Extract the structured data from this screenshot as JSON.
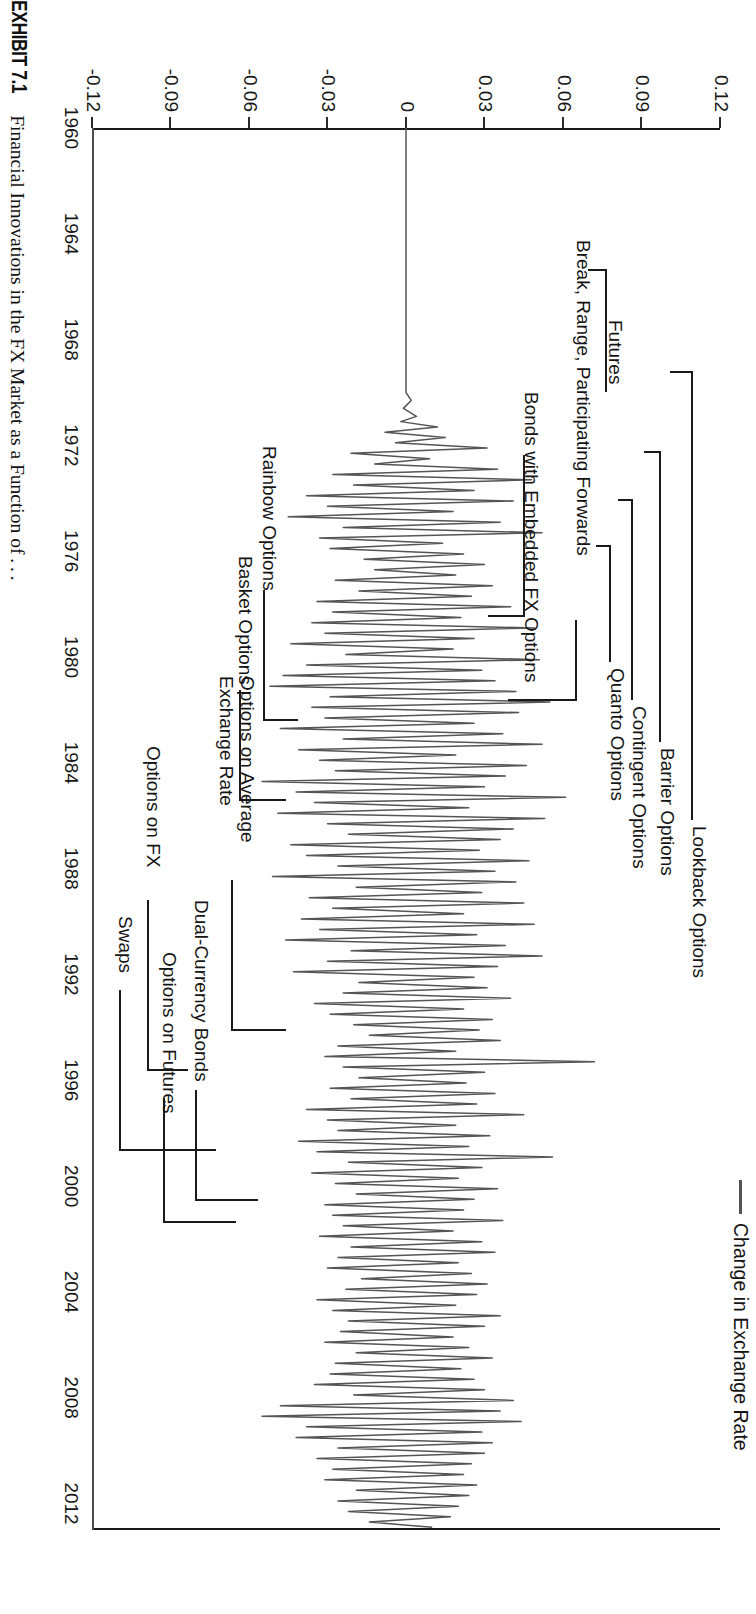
{
  "figure": {
    "exhibit_label": "EXHIBIT 7.1",
    "caption": "Financial Innovations in the FX Market as a Function of . . ."
  },
  "legend": {
    "series_label": "Change in Exchange Rate",
    "swatch_color": "#555555"
  },
  "axes": {
    "y_axis_title": "Percent Change",
    "y_ticks": [
      "0.12",
      "0.09",
      "0.06",
      "0.03",
      "0",
      "-0.03",
      "-0.06",
      "-0.09",
      "-0.12"
    ],
    "x_ticks": [
      "1960",
      "1964",
      "1968",
      "1972",
      "1976",
      "1980",
      "1984",
      "1988",
      "1992",
      "1996",
      "2000",
      "2004",
      "2008",
      "2012"
    ]
  },
  "annotations": {
    "futures": "Futures",
    "bonds_embedded": "Bonds with Embedded FX Options",
    "break_range": "Break, Range, Participating Forwards",
    "lookback": "Lookback Options",
    "barrier": "Barrier Options",
    "contingent": "Contingent Options",
    "quanto": "Quanto Options",
    "options_on_fx": "Options on FX",
    "swaps": "Swaps",
    "options_on_futures": "Options on Futures",
    "dual_currency": "Dual-Currency Bonds",
    "options_avg_rate": "Options on Average Exchange Rate",
    "basket": "Basket Options",
    "rainbow": "Rainbow Options"
  },
  "chart_data": {
    "type": "line",
    "xlabel": "",
    "ylabel": "Percent Change",
    "series_name": "Change in Exchange Rate",
    "xlim": [
      1960,
      2013
    ],
    "ylim": [
      -0.12,
      0.12
    ],
    "grid": false,
    "legend_position": "top-right",
    "x_tick_values": [
      1960,
      1964,
      1968,
      1972,
      1976,
      1980,
      1984,
      1988,
      1992,
      1996,
      2000,
      2004,
      2008,
      2012
    ],
    "y_tick_values": [
      -0.12,
      -0.09,
      -0.06,
      -0.03,
      0,
      0.03,
      0.06,
      0.09,
      0.12
    ],
    "note": "Monthly percent change in the exchange rate; flat (zero) from 1960 until the early 1970s collapse of Bretton Woods, then persistently volatile.",
    "x": [
      1960.0,
      1960.5,
      1961.0,
      1961.5,
      1962.0,
      1962.5,
      1963.0,
      1963.5,
      1964.0,
      1964.5,
      1965.0,
      1965.5,
      1966.0,
      1966.5,
      1967.0,
      1967.5,
      1968.0,
      1968.5,
      1969.0,
      1969.5,
      1970.0,
      1970.3,
      1970.6,
      1970.9,
      1971.1,
      1971.3,
      1971.5,
      1971.7,
      1971.9,
      1972.1,
      1972.3,
      1972.5,
      1972.7,
      1972.9,
      1973.1,
      1973.3,
      1973.5,
      1973.7,
      1973.9,
      1974.1,
      1974.3,
      1974.5,
      1974.7,
      1974.9,
      1975.1,
      1975.3,
      1975.5,
      1975.7,
      1975.9,
      1976.1,
      1976.3,
      1976.5,
      1976.7,
      1976.9,
      1977.1,
      1977.3,
      1977.5,
      1977.7,
      1977.9,
      1978.1,
      1978.3,
      1978.5,
      1978.7,
      1978.9,
      1979.1,
      1979.3,
      1979.5,
      1979.7,
      1979.9,
      1980.1,
      1980.3,
      1980.5,
      1980.7,
      1980.9,
      1981.1,
      1981.3,
      1981.5,
      1981.7,
      1981.9,
      1982.1,
      1982.3,
      1982.5,
      1982.7,
      1982.9,
      1983.1,
      1983.3,
      1983.5,
      1983.7,
      1983.9,
      1984.1,
      1984.3,
      1984.5,
      1984.7,
      1984.9,
      1985.1,
      1985.3,
      1985.5,
      1985.7,
      1985.9,
      1986.1,
      1986.3,
      1986.5,
      1986.7,
      1986.9,
      1987.1,
      1987.3,
      1987.5,
      1987.7,
      1987.9,
      1988.1,
      1988.3,
      1988.5,
      1988.7,
      1988.9,
      1989.1,
      1989.3,
      1989.5,
      1989.7,
      1989.9,
      1990.1,
      1990.3,
      1990.5,
      1990.7,
      1990.9,
      1991.1,
      1991.3,
      1991.5,
      1991.7,
      1991.9,
      1992.1,
      1992.3,
      1992.5,
      1992.7,
      1992.9,
      1993.1,
      1993.3,
      1993.5,
      1993.7,
      1993.9,
      1994.1,
      1994.3,
      1994.5,
      1994.7,
      1994.9,
      1995.1,
      1995.3,
      1995.5,
      1995.7,
      1995.9,
      1996.1,
      1996.3,
      1996.5,
      1996.7,
      1996.9,
      1997.1,
      1997.3,
      1997.5,
      1997.7,
      1997.9,
      1998.1,
      1998.3,
      1998.5,
      1998.7,
      1998.9,
      1999.1,
      1999.3,
      1999.5,
      1999.7,
      1999.9,
      2000.1,
      2000.3,
      2000.5,
      2000.7,
      2000.9,
      2001.1,
      2001.3,
      2001.5,
      2001.7,
      2001.9,
      2002.1,
      2002.3,
      2002.5,
      2002.7,
      2002.9,
      2003.1,
      2003.3,
      2003.5,
      2003.7,
      2003.9,
      2004.1,
      2004.3,
      2004.5,
      2004.7,
      2004.9,
      2005.1,
      2005.3,
      2005.5,
      2005.7,
      2005.9,
      2006.1,
      2006.3,
      2006.5,
      2006.7,
      2006.9,
      2007.1,
      2007.3,
      2007.5,
      2007.7,
      2007.9,
      2008.1,
      2008.3,
      2008.5,
      2008.7,
      2008.9,
      2009.1,
      2009.3,
      2009.5,
      2009.7,
      2009.9,
      2010.1,
      2010.3,
      2010.5,
      2010.7,
      2010.9,
      2011.1,
      2011.3,
      2011.5,
      2011.7,
      2011.9,
      2012.1,
      2012.3,
      2012.5,
      2012.7,
      2012.9
    ],
    "y": [
      0,
      0,
      0,
      0,
      0,
      0,
      0,
      0,
      0,
      0,
      0,
      0,
      0,
      0,
      0,
      0,
      0,
      0,
      0,
      0,
      0,
      0.002,
      -0.001,
      0.004,
      -0.002,
      0.012,
      -0.008,
      0.015,
      -0.004,
      0.031,
      -0.021,
      0.009,
      -0.012,
      0.035,
      -0.028,
      0.048,
      -0.02,
      0.026,
      -0.038,
      0.041,
      -0.03,
      0.018,
      -0.045,
      0.036,
      -0.024,
      0.052,
      -0.033,
      0.014,
      -0.029,
      0.022,
      -0.016,
      0.03,
      -0.012,
      0.019,
      -0.027,
      0.033,
      -0.018,
      0.025,
      -0.034,
      0.04,
      -0.028,
      0.021,
      -0.036,
      0.049,
      -0.031,
      0.026,
      -0.044,
      0.018,
      -0.023,
      0.051,
      -0.038,
      0.029,
      -0.047,
      0.034,
      -0.052,
      0.042,
      -0.029,
      0.055,
      -0.036,
      0.043,
      -0.031,
      0.026,
      -0.048,
      0.037,
      -0.024,
      0.052,
      -0.041,
      0.019,
      -0.033,
      0.046,
      -0.027,
      0.038,
      -0.055,
      0.03,
      -0.042,
      0.061,
      -0.035,
      0.024,
      -0.049,
      0.053,
      -0.03,
      0.041,
      -0.022,
      0.036,
      -0.044,
      0.028,
      -0.038,
      0.047,
      -0.026,
      0.034,
      -0.051,
      0.042,
      -0.019,
      0.029,
      -0.037,
      0.045,
      -0.028,
      0.022,
      -0.04,
      0.049,
      -0.033,
      0.027,
      -0.046,
      0.038,
      -0.021,
      0.052,
      -0.03,
      0.035,
      -0.043,
      0.026,
      -0.018,
      0.031,
      -0.024,
      0.04,
      -0.035,
      0.022,
      -0.029,
      0.033,
      -0.02,
      0.028,
      -0.014,
      0.036,
      -0.026,
      0.019,
      -0.031,
      0.072,
      -0.024,
      0.03,
      -0.018,
      0.023,
      -0.029,
      0.034,
      -0.021,
      0.027,
      -0.038,
      0.045,
      -0.03,
      0.019,
      -0.026,
      0.032,
      -0.041,
      0.024,
      -0.034,
      0.056,
      -0.022,
      0.029,
      -0.036,
      0.02,
      -0.027,
      0.035,
      -0.019,
      0.026,
      -0.031,
      0.022,
      -0.028,
      0.037,
      -0.024,
      0.018,
      -0.033,
      0.029,
      -0.021,
      0.034,
      -0.026,
      0.02,
      -0.03,
      0.025,
      -0.017,
      0.031,
      -0.023,
      0.027,
      -0.034,
      0.019,
      -0.028,
      0.036,
      -0.022,
      0.03,
      -0.025,
      0.018,
      -0.031,
      0.024,
      -0.019,
      0.033,
      -0.027,
      0.021,
      -0.029,
      0.026,
      -0.035,
      0.03,
      -0.02,
      0.041,
      -0.048,
      0.036,
      -0.055,
      0.044,
      -0.038,
      0.029,
      -0.042,
      0.033,
      -0.026,
      0.03,
      -0.034,
      0.025,
      -0.028,
      0.022,
      -0.031,
      0.027,
      -0.019,
      0.024,
      -0.026,
      0.02,
      -0.022,
      0.017,
      -0.014,
      0.01
    ]
  }
}
